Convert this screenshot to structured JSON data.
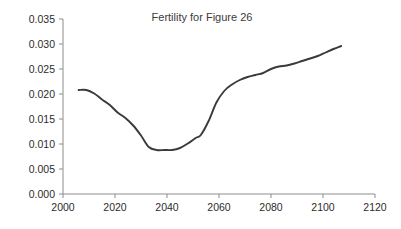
{
  "chart_data": {
    "type": "line",
    "title": "Fertility for Figure 26",
    "xlabel": "",
    "ylabel": "",
    "xlim": [
      2000,
      2120
    ],
    "ylim": [
      0.0,
      0.035
    ],
    "grid": false,
    "legend": "none",
    "xticks": [
      2000,
      2020,
      2040,
      2060,
      2080,
      2100,
      2120
    ],
    "xticklabels": [
      "2000",
      "2020",
      "2040",
      "2060",
      "2080",
      "2100",
      "2120"
    ],
    "yticks": [
      0.0,
      0.005,
      0.01,
      0.015,
      0.02,
      0.025,
      0.03,
      0.035
    ],
    "yticklabels": [
      "0.000",
      "0.005",
      "0.010",
      "0.015",
      "0.020",
      "0.025",
      "0.030",
      "0.035"
    ],
    "line_color": "#3a3a3a",
    "axis_color": "#8c8c8c",
    "series": [
      {
        "name": "Fertility",
        "x": [
          2006,
          2009,
          2012,
          2015,
          2018,
          2021,
          2024,
          2027,
          2030,
          2033,
          2036,
          2039,
          2042,
          2045,
          2048,
          2051,
          2053,
          2056,
          2059,
          2062,
          2065,
          2068,
          2071,
          2074,
          2077,
          2080,
          2083,
          2086,
          2089,
          2092,
          2095,
          2098,
          2101,
          2104,
          2107
        ],
        "y": [
          0.0208,
          0.0208,
          0.0201,
          0.0189,
          0.0178,
          0.0163,
          0.0152,
          0.0137,
          0.0117,
          0.0094,
          0.0088,
          0.0088,
          0.0088,
          0.0092,
          0.0101,
          0.0112,
          0.0118,
          0.0146,
          0.0183,
          0.0206,
          0.0219,
          0.0228,
          0.0234,
          0.0238,
          0.0242,
          0.025,
          0.0255,
          0.0257,
          0.0261,
          0.0266,
          0.0271,
          0.0276,
          0.0283,
          0.029,
          0.0296
        ]
      }
    ]
  }
}
